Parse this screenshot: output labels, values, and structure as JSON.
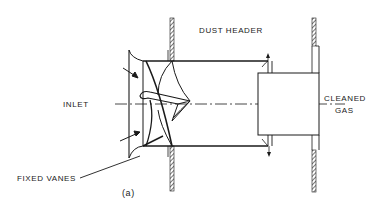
{
  "figure": {
    "caption": "(a)",
    "labels": {
      "dust_header": "DUST HEADER",
      "inlet": "INLET",
      "cleaned_line1": "CLEANED",
      "cleaned_line2": "GAS",
      "fixed_vanes": "FIXED VANES"
    },
    "colors": {
      "ink": "#1a1a1a",
      "background": "#ffffff"
    }
  }
}
